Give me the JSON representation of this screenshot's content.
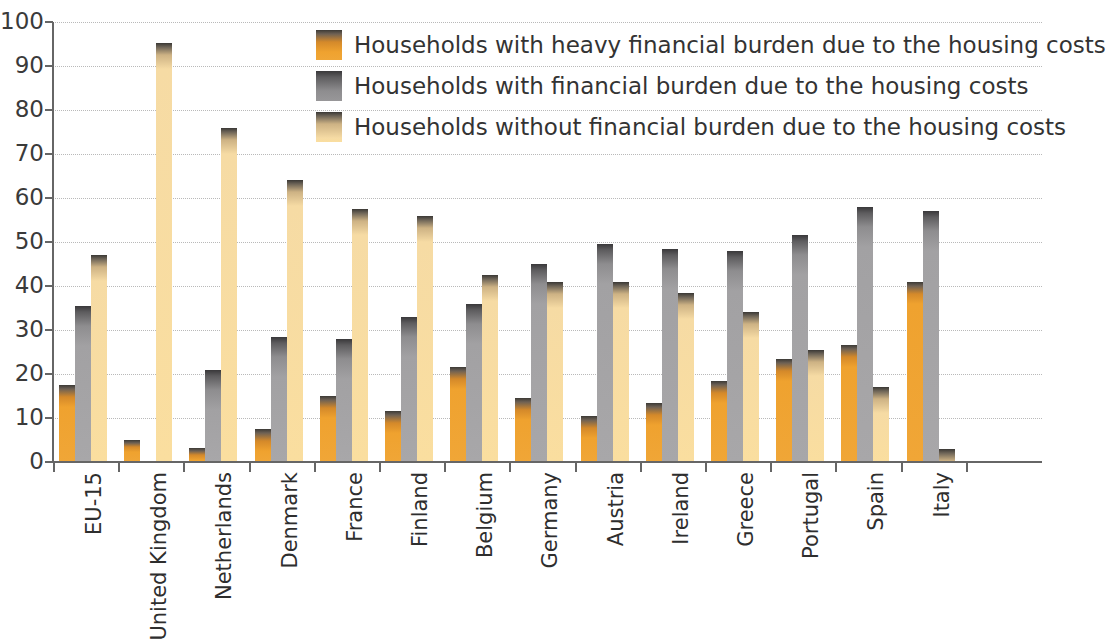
{
  "chart_data": {
    "type": "bar",
    "title": "",
    "subtitle": "",
    "xlabel": "",
    "ylabel": "",
    "ylim": [
      0,
      100
    ],
    "yticks": [
      0,
      10,
      20,
      30,
      40,
      50,
      60,
      70,
      80,
      90,
      100
    ],
    "ytick_labels": [
      "0",
      "10",
      "20",
      "30",
      "40",
      "50",
      "60",
      "70",
      "80",
      "90",
      "100"
    ],
    "grid": true,
    "legend_position": "upper-center",
    "categories": [
      "EU-15",
      "United Kingdom",
      "Netherlands",
      "Denmark",
      "France",
      "Finland",
      "Belgium",
      "Germany",
      "Austria",
      "Ireland",
      "Greece",
      "Portugal",
      "Spain",
      "Italy"
    ],
    "series": [
      {
        "name": "Households with heavy financial burden due to the housing costs",
        "color": "#f0a637",
        "values": [
          17.5,
          5.0,
          3.2,
          7.5,
          15.0,
          11.5,
          21.5,
          14.5,
          10.5,
          13.5,
          18.5,
          23.5,
          26.5,
          41.0
        ]
      },
      {
        "name": "Households with financial burden due to the housing costs",
        "color": "#a8a7a9",
        "values": [
          35.5,
          0,
          20.8,
          28.5,
          28.0,
          33.0,
          36.0,
          45.0,
          49.5,
          48.5,
          48.0,
          51.5,
          58.0,
          57.0
        ]
      },
      {
        "name": "Households without financial burden due to the housing costs",
        "color": "#fade9f",
        "values": [
          47.0,
          95.2,
          76.0,
          64.0,
          57.5,
          56.0,
          42.5,
          41.0,
          41.0,
          38.5,
          34.0,
          25.5,
          17.0,
          3.0
        ]
      }
    ]
  },
  "legend": {
    "items": [
      {
        "label": "Households with heavy financial burden due to the housing costs"
      },
      {
        "label": "Households with financial burden due to the housing costs"
      },
      {
        "label": "Households without financial burden due to the housing costs"
      }
    ]
  }
}
